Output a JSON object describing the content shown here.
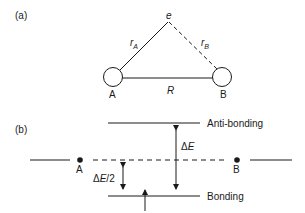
{
  "panel_a": {
    "label": "(a)",
    "electron": "e",
    "r_a": "r",
    "r_a_sub": "A",
    "r_b": "r",
    "r_b_sub": "B",
    "distance": "R",
    "nucleus_a": "A",
    "nucleus_b": "B"
  },
  "panel_b": {
    "label": "(b)",
    "antibonding": "Anti-bonding",
    "bonding": "Bonding",
    "delta_e": "ΔE",
    "delta_e_half": "ΔE/2",
    "atom_a": "A",
    "atom_b": "B"
  }
}
